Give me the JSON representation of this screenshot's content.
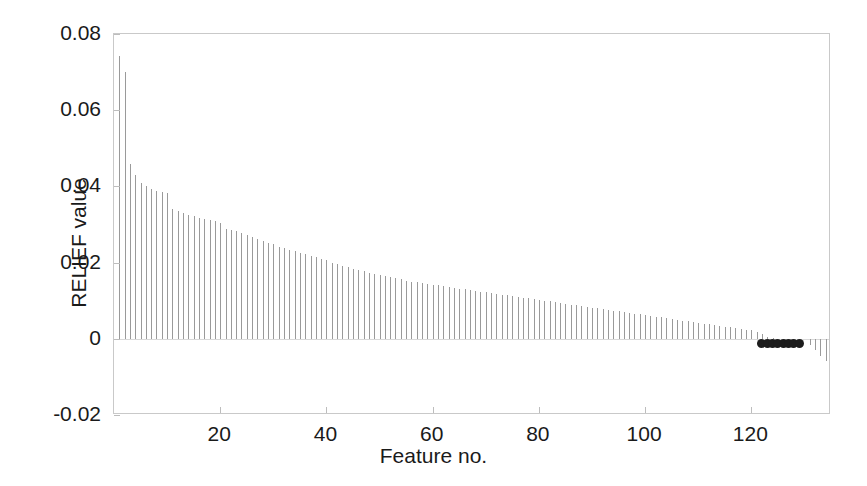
{
  "chart_data": {
    "type": "bar",
    "title": "",
    "subtitle": "",
    "xlabel": "Feature no.",
    "ylabel": "RELIEF value",
    "xlim": [
      0,
      135
    ],
    "ylim": [
      -0.02,
      0.08
    ],
    "xticks": [
      20,
      40,
      60,
      80,
      100,
      120
    ],
    "xticklabels": [
      "20",
      "40",
      "60",
      "80",
      "100",
      "120"
    ],
    "yticks": [
      -0.02,
      0,
      0.02,
      0.04,
      0.06,
      0.08
    ],
    "yticklabels": [
      "-0.02",
      "0",
      "0.02",
      "0.04",
      "0.06",
      "0.08"
    ],
    "grid": false,
    "legend": null,
    "style": "stem",
    "bar_color": "#9a9a9a",
    "marker_color": "#1c1c1c",
    "axis_color": "#c9c9c9",
    "background": "#ffffff",
    "x": [
      1,
      2,
      3,
      4,
      5,
      6,
      7,
      8,
      9,
      10,
      11,
      12,
      13,
      14,
      15,
      16,
      17,
      18,
      19,
      20,
      21,
      22,
      23,
      24,
      25,
      26,
      27,
      28,
      29,
      30,
      31,
      32,
      33,
      34,
      35,
      36,
      37,
      38,
      39,
      40,
      41,
      42,
      43,
      44,
      45,
      46,
      47,
      48,
      49,
      50,
      51,
      52,
      53,
      54,
      55,
      56,
      57,
      58,
      59,
      60,
      61,
      62,
      63,
      64,
      65,
      66,
      67,
      68,
      69,
      70,
      71,
      72,
      73,
      74,
      75,
      76,
      77,
      78,
      79,
      80,
      81,
      82,
      83,
      84,
      85,
      86,
      87,
      88,
      89,
      90,
      91,
      92,
      93,
      94,
      95,
      96,
      97,
      98,
      99,
      100,
      101,
      102,
      103,
      104,
      105,
      106,
      107,
      108,
      109,
      110,
      111,
      112,
      113,
      114,
      115,
      116,
      117,
      118,
      119,
      120,
      121,
      122,
      123,
      124,
      125,
      126,
      127,
      128,
      129,
      130,
      131,
      132,
      133,
      134
    ],
    "values": [
      0.0742,
      0.07,
      0.0458,
      0.043,
      0.041,
      0.04,
      0.0392,
      0.0388,
      0.0385,
      0.0382,
      0.034,
      0.0335,
      0.033,
      0.0326,
      0.0322,
      0.0318,
      0.0315,
      0.0312,
      0.0308,
      0.0305,
      0.0288,
      0.0285,
      0.0282,
      0.0278,
      0.0272,
      0.0268,
      0.0262,
      0.0258,
      0.0252,
      0.0248,
      0.0242,
      0.0238,
      0.0234,
      0.023,
      0.0226,
      0.0222,
      0.0218,
      0.0214,
      0.021,
      0.0206,
      0.02,
      0.0196,
      0.0192,
      0.0188,
      0.0184,
      0.018,
      0.0177,
      0.0174,
      0.0171,
      0.0168,
      0.0165,
      0.0162,
      0.0159,
      0.0156,
      0.0153,
      0.015,
      0.0148,
      0.0146,
      0.0144,
      0.0142,
      0.014,
      0.0138,
      0.0136,
      0.0134,
      0.0132,
      0.013,
      0.0128,
      0.0126,
      0.0124,
      0.0122,
      0.012,
      0.0118,
      0.0116,
      0.0114,
      0.0112,
      0.011,
      0.0108,
      0.0106,
      0.0104,
      0.0102,
      0.01,
      0.0098,
      0.0096,
      0.0094,
      0.0092,
      0.009,
      0.0088,
      0.0086,
      0.0084,
      0.0082,
      0.008,
      0.0078,
      0.0076,
      0.0074,
      0.0072,
      0.007,
      0.0068,
      0.0066,
      0.0064,
      0.0062,
      0.006,
      0.0058,
      0.0056,
      0.0054,
      0.0052,
      0.005,
      0.0048,
      0.0046,
      0.0044,
      0.0042,
      0.004,
      0.0038,
      0.0036,
      0.0034,
      0.0032,
      0.003,
      0.0028,
      0.0026,
      0.0024,
      0.0022,
      0.0018,
      0.0012,
      0.0006,
      0.0002,
      0.0,
      0.0,
      0.0,
      0.0,
      0.0,
      0.0,
      -0.0016,
      -0.003,
      -0.0044,
      -0.0058
    ],
    "highlighted_points": {
      "label": "selected-features-marker-cluster",
      "x": [
        122,
        123,
        124,
        125,
        126,
        127,
        128,
        129
      ],
      "y": [
        -0.0012,
        -0.0012,
        -0.0012,
        -0.0012,
        -0.0012,
        -0.0012,
        -0.0012,
        -0.0012
      ],
      "marker": "filled-circle",
      "color": "#1c1c1c"
    }
  }
}
